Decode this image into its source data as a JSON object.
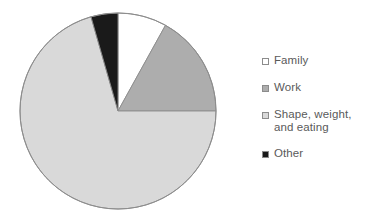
{
  "chart_data": {
    "type": "pie",
    "title": "",
    "subtitle": "",
    "xlabel": "",
    "ylabel": "",
    "grid": false,
    "legend_position": "right",
    "start_angle_deg": 0,
    "direction": "clockwise",
    "categories": [
      "Family",
      "Work",
      "Shape, weight, and eating",
      "Other"
    ],
    "values": [
      8,
      17,
      70.5,
      4.5
    ],
    "units": "percent",
    "colors": [
      "#ffffff",
      "#adadad",
      "#d9d9d9",
      "#1a1a1a"
    ],
    "slices": [
      {
        "label": "Family",
        "value": 8,
        "start_deg": 0,
        "end_deg": 29,
        "color": "#ffffff"
      },
      {
        "label": "Work",
        "value": 17,
        "start_deg": 29,
        "end_deg": 90,
        "color": "#adadad"
      },
      {
        "label": "Shape, weight, and eating",
        "value": 70.5,
        "start_deg": 90,
        "end_deg": 344,
        "color": "#d9d9d9"
      },
      {
        "label": "Other",
        "value": 4.5,
        "start_deg": 344,
        "end_deg": 360,
        "color": "#1a1a1a"
      }
    ]
  },
  "pie": {
    "center_x": 118,
    "center_y": 111,
    "radius": 98,
    "outline_color": "#8c8c8c"
  },
  "legend": {
    "items": [
      {
        "label": "Family",
        "color": "#ffffff"
      },
      {
        "label": "Work",
        "color": "#adadad"
      },
      {
        "label": "Shape, weight,\nand eating",
        "color": "#d9d9d9"
      },
      {
        "label": "Other",
        "color": "#1a1a1a"
      }
    ]
  }
}
